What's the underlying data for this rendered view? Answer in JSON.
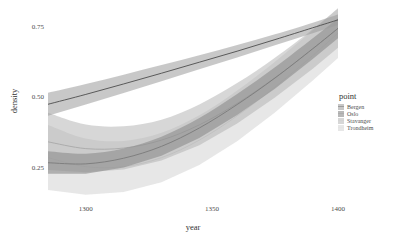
{
  "chart_data": {
    "type": "area",
    "title": "",
    "subtitle": "",
    "xlabel": "year",
    "ylabel": "density",
    "xlim": [
      1285,
      1400
    ],
    "ylim": [
      0.14,
      0.82
    ],
    "xticks": [
      1300,
      1350,
      1400
    ],
    "xticklabels": [
      "1300",
      "1350",
      "1400"
    ],
    "yticks": [
      0.25,
      0.5,
      0.75
    ],
    "yticklabels": [
      "0.25",
      "0.50",
      "0.75"
    ],
    "grid": false,
    "legend_position": "right",
    "legend_title": "point",
    "x": [
      1285,
      1300,
      1315,
      1330,
      1345,
      1360,
      1375,
      1390,
      1400
    ],
    "series": [
      {
        "name": "Bergen",
        "color": "#4d4d4d",
        "fill": "#9a9a9a",
        "fill_opacity": 0.55,
        "mean": [
          0.479,
          0.514,
          0.551,
          0.589,
          0.628,
          0.667,
          0.708,
          0.75,
          0.778
        ],
        "lower": [
          0.438,
          0.478,
          0.519,
          0.561,
          0.603,
          0.645,
          0.688,
          0.731,
          0.76
        ],
        "upper": [
          0.52,
          0.551,
          0.584,
          0.618,
          0.653,
          0.689,
          0.727,
          0.768,
          0.797
        ]
      },
      {
        "name": "Oslo",
        "color": "#7a7a7a",
        "fill": "#8e8e8e",
        "fill_opacity": 0.62,
        "mean": [
          0.272,
          0.268,
          0.288,
          0.33,
          0.395,
          0.478,
          0.572,
          0.676,
          0.748
        ],
        "lower": [
          0.233,
          0.233,
          0.255,
          0.297,
          0.36,
          0.441,
          0.534,
          0.639,
          0.713
        ],
        "upper": [
          0.313,
          0.304,
          0.322,
          0.364,
          0.43,
          0.515,
          0.61,
          0.713,
          0.784
        ]
      },
      {
        "name": "Stavanger",
        "color": "#a8a8a8",
        "fill": "#b0b0b0",
        "fill_opacity": 0.5,
        "mean": [
          0.346,
          0.322,
          0.324,
          0.352,
          0.406,
          0.482,
          0.573,
          0.675,
          0.748
        ],
        "lower": [
          0.246,
          0.238,
          0.248,
          0.28,
          0.334,
          0.411,
          0.503,
          0.605,
          0.679
        ],
        "upper": [
          0.449,
          0.407,
          0.401,
          0.424,
          0.478,
          0.554,
          0.644,
          0.745,
          0.818
        ]
      },
      {
        "name": "Trondheim",
        "color": "#cfcfcf",
        "fill": "#d4d4d4",
        "fill_opacity": 0.55,
        "mean": [
          0.29,
          0.258,
          0.258,
          0.29,
          0.352,
          0.438,
          0.54,
          0.652,
          0.731
        ],
        "lower": [
          0.175,
          0.159,
          0.168,
          0.203,
          0.264,
          0.348,
          0.45,
          0.563,
          0.643
        ],
        "upper": [
          0.406,
          0.358,
          0.349,
          0.378,
          0.44,
          0.528,
          0.63,
          0.741,
          0.82
        ]
      }
    ]
  },
  "axes": {
    "ylabel": "density",
    "xlabel": "year",
    "yticklabels": [
      "0.75",
      "0.50",
      "0.25"
    ],
    "xticklabels": [
      "1300",
      "1350",
      "1400"
    ]
  },
  "legend": {
    "title": "point",
    "items": [
      {
        "label": "Bergen"
      },
      {
        "label": "Oslo"
      },
      {
        "label": "Stavanger"
      },
      {
        "label": "Trondheim"
      }
    ]
  }
}
